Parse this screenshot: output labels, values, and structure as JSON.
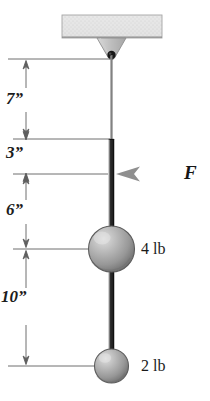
{
  "figure": {
    "background_color": "#ffffff"
  },
  "ceiling": {
    "name": "ceiling-support-block",
    "fill_color": "#e2e2e2",
    "edge_color": "#9a9a9a"
  },
  "bracket": {
    "name": "triangular-bracket",
    "fill_color": "#c9c9c9",
    "edge_color": "#8c8c8c"
  },
  "pivot": {
    "name": "pivot-pin",
    "color": "#1a1a1a"
  },
  "rod": {
    "name": "rigid-rod",
    "color": "#3a3a3a",
    "upper_color": "#6e6e6e"
  },
  "dimensions": [
    {
      "id": "dim-7in",
      "label": "7”",
      "value": 7,
      "unit": "in",
      "from_y": 59,
      "to_y": 139,
      "arrows": "inside"
    },
    {
      "id": "dim-3in",
      "label": "3”",
      "value": 3,
      "unit": "in",
      "from_y": 139,
      "to_y": 174,
      "arrows": "outside"
    },
    {
      "id": "dim-6in",
      "label": "6”",
      "value": 6,
      "unit": "in",
      "from_y": 174,
      "to_y": 249,
      "arrows": "inside"
    },
    {
      "id": "dim-10in",
      "label": "10”",
      "value": 10,
      "unit": "in",
      "from_y": 249,
      "to_y": 366,
      "arrows": "inside"
    }
  ],
  "force": {
    "name": "applied-force",
    "label": "F",
    "direction": "left",
    "color": "#8f8f8f",
    "applied_at_y": 174
  },
  "weights": [
    {
      "id": "weight-4lb",
      "label": "4 lb",
      "value": 4,
      "unit": "lb",
      "center_y": 249,
      "radius": 23,
      "fill_color": "#a8a8a8"
    },
    {
      "id": "weight-2lb",
      "label": "2 lb",
      "value": 2,
      "unit": "lb",
      "center_y": 366,
      "radius": 17,
      "fill_color": "#a8a8a8"
    }
  ],
  "colors": {
    "line": "#555555",
    "text": "#1a1a1a",
    "sphere_light": "#d8d8d8",
    "sphere_dark": "#7e7e7e"
  }
}
